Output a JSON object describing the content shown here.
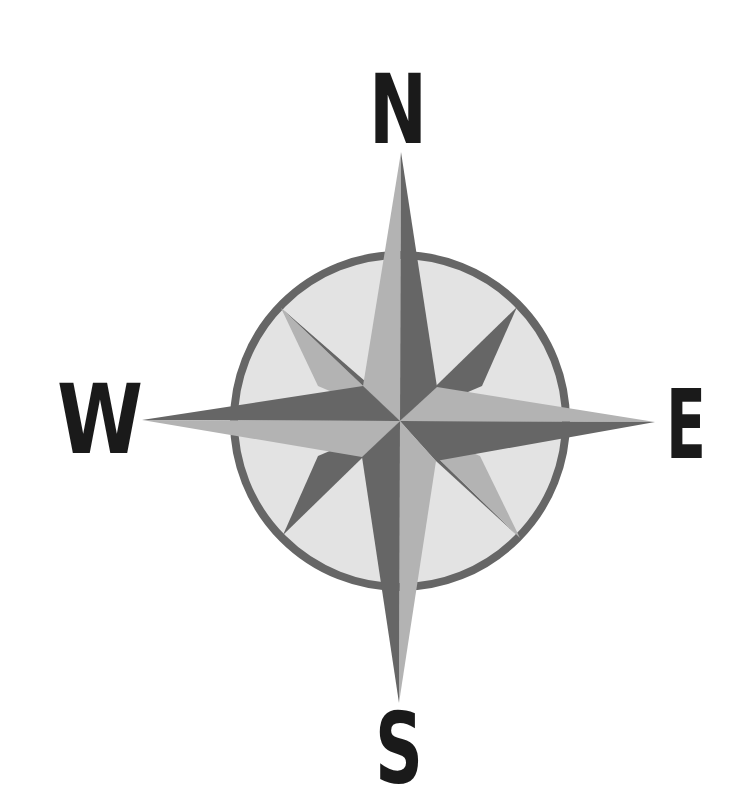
{
  "diagram": {
    "type": "compass-rose",
    "center": [
      400,
      421
    ],
    "labels": {
      "north": "N",
      "south": "S",
      "east": "E",
      "west": "W"
    },
    "colors": {
      "dark": "#666666",
      "light": "#b3b3b3",
      "face": "#e3e3e3",
      "ring": "#666666",
      "text": "#1a1a1a",
      "background": "#ffffff"
    },
    "points": [
      "north",
      "east",
      "south",
      "west",
      "northeast",
      "southeast",
      "southwest",
      "northwest"
    ]
  }
}
